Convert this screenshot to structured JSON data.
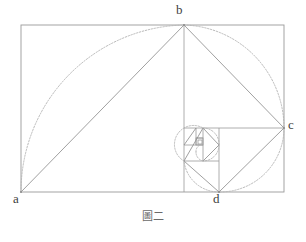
{
  "figure": {
    "caption": "圖二",
    "caption_meaning": "Figure Two",
    "labels": [
      {
        "id": "a",
        "text": "a",
        "x": 21,
        "y": 192,
        "corner": "bottom-left"
      },
      {
        "id": "b",
        "text": "b",
        "x": 184,
        "y": 25,
        "corner": "top-subdivision"
      },
      {
        "id": "c",
        "text": "c",
        "x": 284,
        "y": 128,
        "corner": "right-subdivision"
      },
      {
        "id": "d",
        "text": "d",
        "x": 219,
        "y": 192,
        "corner": "bottom-subdivision"
      }
    ],
    "colors": {
      "solid_stroke": "#8f8f8f",
      "dotted_stroke": "#b0b0b0",
      "frame_stroke": "#9a9a9a",
      "label_text": "#3d3d3d",
      "caption_text": "#6a6a6a",
      "background": "#ffffff"
    },
    "geometry": {
      "outer_rect": {
        "x": 21,
        "y": 25,
        "width": 263,
        "height": 167
      },
      "squares": [
        {
          "index": 1,
          "x": 21,
          "y": 25,
          "size": 167.0,
          "corner": "a"
        },
        {
          "index": 2,
          "x": 188,
          "y": 25,
          "size": 103.0,
          "corner": "b"
        },
        {
          "index": 3,
          "x": 188,
          "y": 128,
          "size": 64.0,
          "corner": "c"
        },
        {
          "index": 4,
          "x": 188,
          "y": 152,
          "size": 39.0,
          "corner": "d"
        },
        {
          "index": 5,
          "x": 212,
          "y": 128,
          "size": 24.0,
          "corner": "e"
        },
        {
          "index": 6,
          "x": 197,
          "y": 128,
          "size": 15.0,
          "corner": "f"
        },
        {
          "index": 7,
          "x": 197,
          "y": 137,
          "size": 9.0,
          "corner": "g"
        }
      ],
      "subdivision_lines": [
        {
          "type": "vertical",
          "x": 184,
          "y1": 25,
          "y2": 192
        },
        {
          "type": "horizontal",
          "y": 128,
          "x1": 184,
          "x2": 284
        },
        {
          "type": "vertical",
          "x": 219,
          "y1": 128,
          "y2": 192
        },
        {
          "type": "horizontal",
          "y": 161,
          "x1": 184,
          "x2": 219
        },
        {
          "type": "vertical",
          "x": 203,
          "y1": 128,
          "y2": 161
        },
        {
          "type": "horizontal",
          "y": 145,
          "x1": 184,
          "x2": 203
        }
      ],
      "diagonals": [
        {
          "from": "a",
          "to": "b",
          "x1": 21,
          "y1": 192,
          "x2": 184,
          "y2": 25
        },
        {
          "from": "b",
          "to": "c",
          "x1": 184,
          "y1": 25,
          "x2": 284,
          "y2": 128
        },
        {
          "from": "c",
          "to": "d",
          "x1": 284,
          "y1": 128,
          "x2": 219,
          "y2": 192
        },
        {
          "from": "d",
          "to": "e",
          "x1": 219,
          "y1": 192,
          "x2": 184,
          "y2": 161
        },
        {
          "from": "e",
          "to": "f",
          "x1": 184,
          "y1": 161,
          "x2": 203,
          "y2": 128
        },
        {
          "from": "f",
          "to": "g",
          "x1": 203,
          "y1": 128,
          "x2": 219,
          "y2": 145
        }
      ],
      "arcs": [
        {
          "index": 1,
          "from_x": 21,
          "from_y": 192,
          "to_x": 184,
          "to_y": 25,
          "radius": 167,
          "center_x": 184,
          "center_y": 192
        },
        {
          "index": 2,
          "from_x": 184,
          "from_y": 25,
          "to_x": 284,
          "to_y": 128,
          "radius": 103,
          "center_x": 184,
          "center_y": 128
        },
        {
          "index": 3,
          "from_x": 284,
          "from_y": 128,
          "to_x": 219,
          "to_y": 192,
          "radius": 64,
          "center_x": 219,
          "center_y": 128
        },
        {
          "index": 4,
          "from_x": 219,
          "from_y": 192,
          "to_x": 184,
          "to_y": 161,
          "radius": 35,
          "center_x": 184,
          "center_y": 192
        },
        {
          "index": 5,
          "from_x": 184,
          "from_y": 161,
          "to_x": 203,
          "to_y": 128,
          "radius": 19,
          "center_x": 203,
          "center_y": 161
        },
        {
          "index": 6,
          "from_x": 203,
          "from_y": 128,
          "to_x": 219,
          "to_y": 145,
          "radius": 16,
          "center_x": 203,
          "center_y": 145
        }
      ]
    }
  }
}
